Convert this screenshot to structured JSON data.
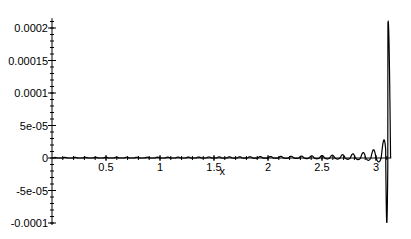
{
  "chart_data": {
    "type": "line",
    "title": "",
    "xlabel": "x",
    "ylabel": "",
    "xlim": [
      0,
      3.1416
    ],
    "ylim": [
      -0.0001,
      0.0002
    ],
    "grid": false,
    "legend": "none",
    "x_ticks": [
      {
        "value": 0.5,
        "label": "0.5"
      },
      {
        "value": 1,
        "label": "1"
      },
      {
        "value": 1.5,
        "label": "1.5"
      },
      {
        "value": 2,
        "label": "2"
      },
      {
        "value": 2.5,
        "label": "2.5"
      },
      {
        "value": 3,
        "label": "3"
      }
    ],
    "y_ticks": [
      {
        "value": 0.0002,
        "label": "0.0002"
      },
      {
        "value": 0.00015,
        "label": "0.00015"
      },
      {
        "value": 0.0001,
        "label": "0.0001"
      },
      {
        "value": 5e-05,
        "label": "5e-05"
      },
      {
        "value": 0,
        "label": "0"
      },
      {
        "value": -5e-05,
        "label": "-5e-05"
      },
      {
        "value": -0.0001,
        "label": "-0.0001"
      }
    ],
    "series": [
      {
        "name": "f(x)",
        "description": "oscillating function with ~33 peaks, near-zero baseline small positive bumps growing in amplitude toward x=pi, last peak ~0.00021 and trough ~-0.0001",
        "peaks": [
          {
            "x": 0.05,
            "y": 3e-06
          },
          {
            "x": 0.5,
            "y": 4e-06
          },
          {
            "x": 1.0,
            "y": 6e-06
          },
          {
            "x": 1.5,
            "y": 9e-06
          },
          {
            "x": 2.0,
            "y": 1.4e-05
          },
          {
            "x": 2.5,
            "y": 2.2e-05
          },
          {
            "x": 2.72,
            "y": 3e-05
          },
          {
            "x": 2.85,
            "y": 4e-05
          },
          {
            "x": 2.95,
            "y": 5.5e-05
          },
          {
            "x": 3.03,
            "y": 8.5e-05
          },
          {
            "x": 3.12,
            "y": 0.00021
          }
        ],
        "troughs": [
          {
            "x": 2.6,
            "y": -5e-06
          },
          {
            "x": 2.8,
            "y": -1.2e-05
          },
          {
            "x": 2.9,
            "y": -2e-05
          },
          {
            "x": 3.0,
            "y": -3.5e-05
          },
          {
            "x": 3.08,
            "y": -0.0001
          }
        ]
      }
    ]
  }
}
